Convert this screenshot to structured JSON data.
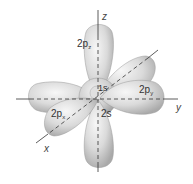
{
  "diagram": {
    "axes": {
      "z": "z",
      "y": "y",
      "x": "x"
    },
    "orbitals": {
      "pz": {
        "main": "2p",
        "sub": "z"
      },
      "py": {
        "main": "2p",
        "sub": "y"
      },
      "px": {
        "main": "2p",
        "sub": "x"
      },
      "s1": "1s",
      "s2": "2s"
    },
    "colors": {
      "lobe_light": "#f4f4f4",
      "lobe_mid": "#d6d6d6",
      "lobe_dark": "#a8a8a8",
      "axis": "#333333",
      "background": "#ffffff"
    }
  }
}
